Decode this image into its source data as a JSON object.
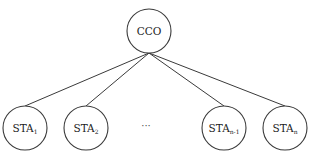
{
  "diagram": {
    "type": "star-topology",
    "colors": {
      "stroke": "#3a3a3a",
      "text": "#222222",
      "background": "#ffffff"
    },
    "root": {
      "label": "CCO",
      "cx": 149,
      "cy": 31,
      "r": 22
    },
    "children": [
      {
        "label": "STA",
        "subscript": "1",
        "cx": 25,
        "cy": 128,
        "r": 22
      },
      {
        "label": "STA",
        "subscript": "2",
        "cx": 86,
        "cy": 128,
        "r": 22
      },
      {
        "label": "STA",
        "subscript": "n-1",
        "cx": 224,
        "cy": 128,
        "r": 22
      },
      {
        "label": "STA",
        "subscript": "n",
        "cx": 285,
        "cy": 128,
        "r": 22
      }
    ],
    "ellipsis": {
      "text": "···",
      "x": 146,
      "y": 129
    }
  }
}
